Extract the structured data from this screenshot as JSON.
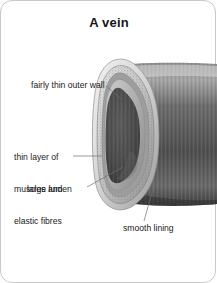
{
  "card": {
    "title": "A vein",
    "border_color": "#c9c9c9",
    "background_color": "#ffffff"
  },
  "diagram": {
    "type": "anatomical-cross-section",
    "subject": "vein",
    "view": "cut-away 3D tube",
    "palette": {
      "tube_outer_dark": "#5f5f5f",
      "tube_outer_light": "#d8d8d8",
      "outer_wall_rim": "#efefef",
      "muscle_layer_speckle": "#bdbdbd",
      "smooth_lining": "#b4b4b4",
      "lumen_dark": "#4a4a4a",
      "leader_line": "#6e6e6e"
    },
    "layers": [
      {
        "name": "fairly thin outer wall",
        "order": 1
      },
      {
        "name": "thin layer of muscles and elastic fibres",
        "order": 2
      },
      {
        "name": "smooth lining",
        "order": 3
      },
      {
        "name": "large lumen",
        "order": 4
      }
    ]
  },
  "labels": {
    "outer_wall": "fairly thin outer wall",
    "muscle_line1": "thin layer of",
    "muscle_line2": "muscles and",
    "muscle_line3": "elastic fibres",
    "lumen": "large lumen",
    "lining": "smooth lining"
  }
}
